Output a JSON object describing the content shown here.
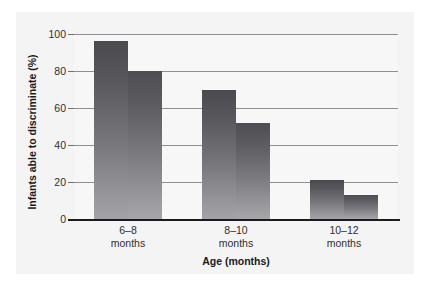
{
  "figure": {
    "caption": "Distinguishing phonemes in a native vs. a foreign language"
  },
  "colors": {
    "bar_top": "#4a4a4e",
    "bar_bottom": "#a2a2a7",
    "gridline": "#8e8e93",
    "axis": "#1b1b1d",
    "plot_background": "#f7f7f8",
    "panel_background": "#f4f4f5",
    "text": "#1b1b1d"
  },
  "chart_data": {
    "type": "bar",
    "title": "",
    "xlabel": "Age (months)",
    "ylabel": "Infants able to discriminate (%)",
    "categories": [
      "6–8\nmonths",
      "8–10\nmonths",
      "10–12\nmonths"
    ],
    "category_lines": [
      {
        "line1": "6–8",
        "line2": "months"
      },
      {
        "line1": "8–10",
        "line2": "months"
      },
      {
        "line1": "10–12",
        "line2": "months"
      }
    ],
    "series": [
      {
        "name": "Series 1",
        "values": [
          96,
          70,
          21
        ]
      },
      {
        "name": "Series 2",
        "values": [
          80,
          52,
          13
        ]
      }
    ],
    "ylim": [
      0,
      100
    ],
    "yticks": [
      0,
      20,
      40,
      60,
      80,
      100
    ],
    "ytick_labels": [
      "0",
      "20",
      "40",
      "60",
      "80",
      "100"
    ],
    "grid": true,
    "legend": "none"
  }
}
